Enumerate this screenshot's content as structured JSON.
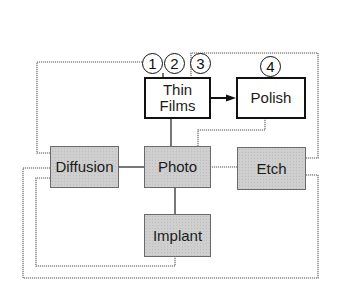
{
  "diagram": {
    "nodes": {
      "thin_films": {
        "label_line1": "Thin",
        "label_line2": "Films",
        "style": "white"
      },
      "polish": {
        "label": "Polish",
        "style": "white"
      },
      "diffusion": {
        "label": "Diffusion",
        "style": "gray"
      },
      "photo": {
        "label": "Photo",
        "style": "gray"
      },
      "etch": {
        "label": "Etch",
        "style": "gray"
      },
      "implant": {
        "label": "Implant",
        "style": "gray"
      }
    },
    "markers": [
      {
        "label": "1"
      },
      {
        "label": "2"
      },
      {
        "label": "3"
      },
      {
        "label": "4"
      }
    ],
    "edges": [
      {
        "from": "Thin Films",
        "to": "Polish",
        "type": "arrow"
      },
      {
        "from": "Thin Films",
        "to": "Photo",
        "type": "line"
      },
      {
        "from": "Polish",
        "to": "Photo",
        "type": "dotted"
      },
      {
        "from": "Diffusion",
        "to": "Photo",
        "type": "line"
      },
      {
        "from": "Photo",
        "to": "Etch",
        "type": "dotted"
      },
      {
        "from": "Photo",
        "to": "Implant",
        "type": "line"
      },
      {
        "from": "Diffusion",
        "to": "Thin Films (1)",
        "type": "dotted-loop"
      },
      {
        "from": "Etch",
        "to": "Thin Films (3)",
        "type": "dotted-loop"
      },
      {
        "from": "Implant",
        "to": "Diffusion",
        "type": "dotted-loop"
      },
      {
        "from": "Etch",
        "to": "Diffusion",
        "type": "dotted-loop"
      }
    ],
    "colors": {
      "box_fill_gray": "#cfcfcf",
      "box_border_black": "#111111",
      "wire_gray": "#8a8a8a"
    }
  }
}
